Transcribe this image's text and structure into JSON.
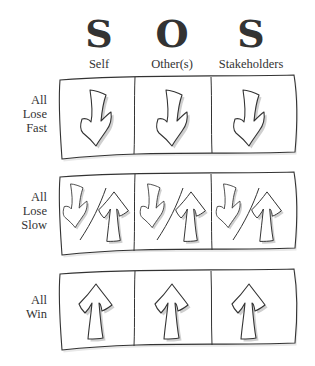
{
  "header": {
    "letters": [
      "S",
      "O",
      "S"
    ],
    "columns": [
      "Self",
      "Other(s)",
      "Stakeholders"
    ]
  },
  "rows": [
    {
      "label_lines": [
        "All",
        "Lose",
        "Fast"
      ],
      "cells": [
        "down",
        "down",
        "down"
      ]
    },
    {
      "label_lines": [
        "All",
        "Lose",
        "Slow"
      ],
      "cells": [
        "down/up",
        "down/up",
        "down/up"
      ]
    },
    {
      "label_lines": [
        "All",
        "Win"
      ],
      "cells": [
        "up",
        "up",
        "up"
      ]
    }
  ],
  "icons": {
    "down": "down-arrow-icon",
    "up": "up-arrow-icon"
  },
  "colors": {
    "ink": "#333333",
    "shadow": "#cccccc",
    "background": "#ffffff"
  }
}
